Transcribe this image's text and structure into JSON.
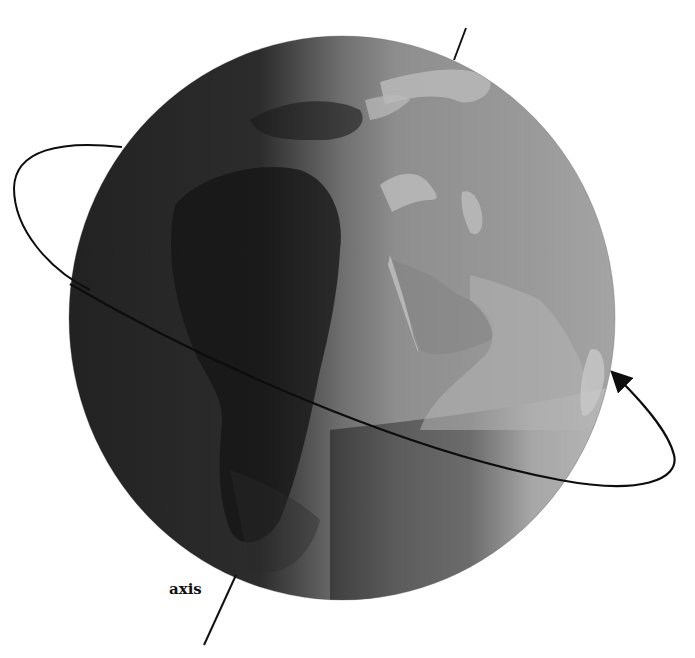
{
  "diagram": {
    "labels": {
      "axis": "axis"
    },
    "globe": {
      "center": [
        342,
        318
      ],
      "radius": [
        273,
        282
      ],
      "shading": {
        "dark": "#1e1e1e",
        "mid": "#6a6a6a",
        "light": "#a8a8a8",
        "lightest": "#c6c6c6"
      },
      "land_dark": "#141414",
      "land_light": "#b9b9b9"
    },
    "orbit_arrow": {
      "color": "#0d0d0d",
      "direction": "counterclockwise (west to east)"
    },
    "axis_line": {
      "color": "#111111"
    }
  }
}
